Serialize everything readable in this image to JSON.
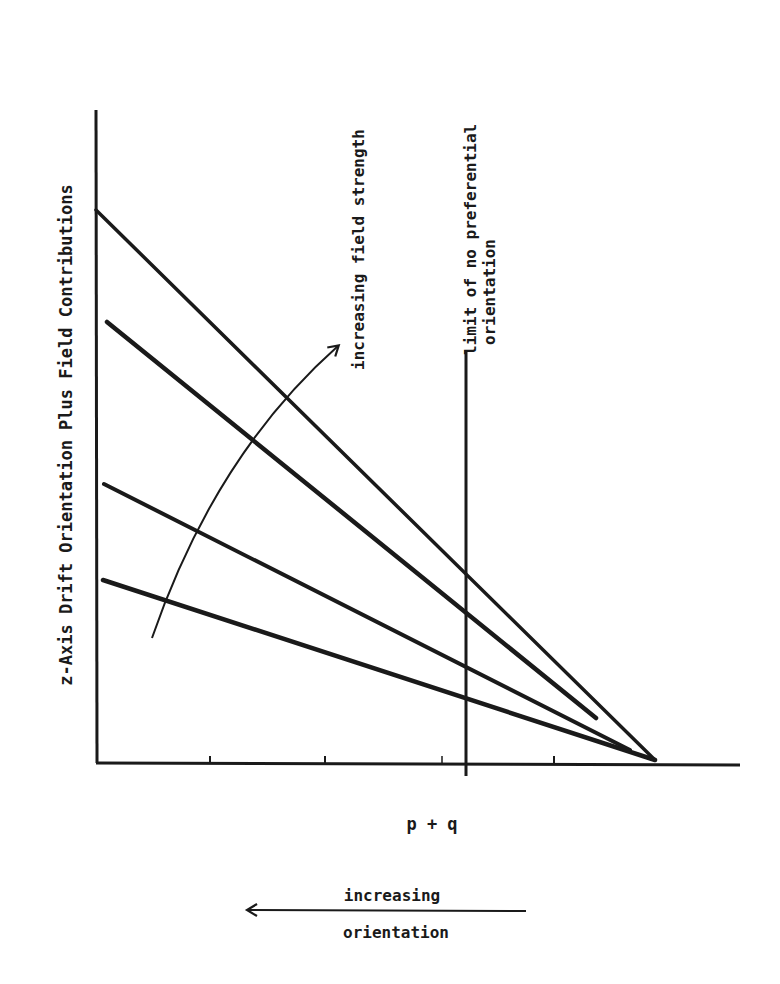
{
  "diagram": {
    "y_axis_label": "z-Axis Drift Orientation Plus Field Contributions",
    "x_axis_label": "p + q",
    "field_arrow_label": "increasing field strength",
    "limit_label_line1": "limit of no preferential",
    "limit_label_line2": "orientation",
    "orientation_arrow_label_top": "increasing",
    "orientation_arrow_label_bottom": "orientation",
    "line_color": "#1a1a1a",
    "lines": [
      {
        "name": "field-line-1",
        "x1": 96,
        "y1": 210,
        "x2": 655,
        "y2": 760
      },
      {
        "name": "field-line-2",
        "x1": 107,
        "y1": 322,
        "x2": 596,
        "y2": 718
      },
      {
        "name": "field-line-3",
        "x1": 104,
        "y1": 484,
        "x2": 630,
        "y2": 750
      },
      {
        "name": "field-line-4",
        "x1": 103,
        "y1": 580,
        "x2": 655,
        "y2": 760
      }
    ],
    "x_ticks": [
      210,
      325,
      442,
      554
    ]
  }
}
